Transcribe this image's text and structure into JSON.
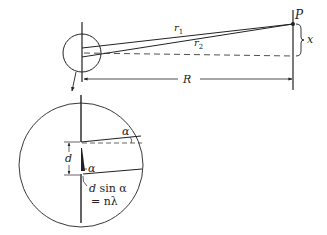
{
  "diagram": {
    "type": "double-slit geometry",
    "labels": {
      "point": "P",
      "r1": "r",
      "r1_sub": "1",
      "r2": "r",
      "r2_sub": "2",
      "x": "x",
      "R": "R",
      "d": "d",
      "alpha_top": "α",
      "alpha_bottom": "α",
      "path_diff_line1_d": "d",
      "path_diff_line1_rest": " sin α",
      "path_diff_line2": "= nλ"
    },
    "colors": {
      "stroke": "#222222",
      "background": "#ffffff"
    }
  }
}
